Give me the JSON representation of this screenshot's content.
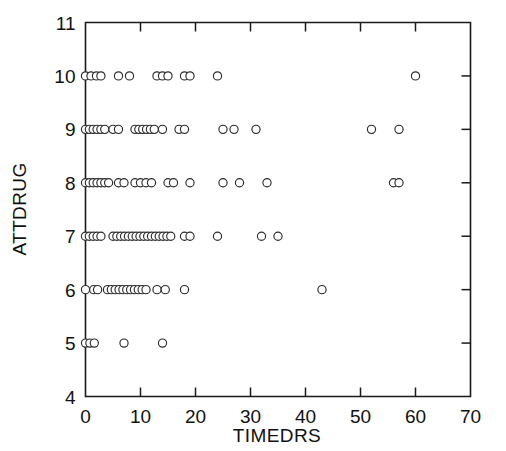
{
  "chart_data": {
    "type": "scatter",
    "title": "",
    "xlabel": "TIMEDRS",
    "ylabel": "ATTDRUG",
    "xlim": [
      0,
      70
    ],
    "ylim": [
      4,
      11
    ],
    "xticks": [
      0,
      10,
      20,
      30,
      40,
      50,
      60,
      70
    ],
    "yticks": [
      4,
      5,
      6,
      7,
      8,
      9,
      10,
      11
    ],
    "xtick_labels": [
      "0",
      "10",
      "20",
      "30",
      "40",
      "50",
      "60",
      "70"
    ],
    "ytick_labels": [
      "4",
      "5",
      "6",
      "7",
      "8",
      "9",
      "10",
      "11"
    ],
    "grid": false,
    "legend": null,
    "marker": "open-circle",
    "marker_color": "#2b2b2b",
    "marker_fill": "#ffffff",
    "series": [
      {
        "name": "observations",
        "points": [
          [
            0,
            10
          ],
          [
            1,
            10
          ],
          [
            2,
            10
          ],
          [
            2.8,
            10
          ],
          [
            6,
            10
          ],
          [
            8,
            10
          ],
          [
            13,
            10
          ],
          [
            14,
            10
          ],
          [
            15,
            10
          ],
          [
            18,
            10
          ],
          [
            19,
            10
          ],
          [
            24,
            10
          ],
          [
            60,
            10
          ],
          [
            0,
            9
          ],
          [
            0.7,
            9
          ],
          [
            1.4,
            9
          ],
          [
            2.1,
            9
          ],
          [
            2.8,
            9
          ],
          [
            3.5,
            9
          ],
          [
            5,
            9
          ],
          [
            6,
            9
          ],
          [
            9,
            9
          ],
          [
            9.7,
            9
          ],
          [
            10.4,
            9
          ],
          [
            11.1,
            9
          ],
          [
            11.8,
            9
          ],
          [
            12.5,
            9
          ],
          [
            14,
            9
          ],
          [
            17,
            9
          ],
          [
            18,
            9
          ],
          [
            25,
            9
          ],
          [
            27,
            9
          ],
          [
            31,
            9
          ],
          [
            52,
            9
          ],
          [
            57,
            9
          ],
          [
            0,
            8
          ],
          [
            0.7,
            8
          ],
          [
            1.4,
            8
          ],
          [
            2.1,
            8
          ],
          [
            2.8,
            8
          ],
          [
            3.5,
            8
          ],
          [
            4.2,
            8
          ],
          [
            6,
            8
          ],
          [
            7,
            8
          ],
          [
            9,
            8
          ],
          [
            10,
            8
          ],
          [
            11,
            8
          ],
          [
            12,
            8
          ],
          [
            15,
            8
          ],
          [
            16,
            8
          ],
          [
            19,
            8
          ],
          [
            25,
            8
          ],
          [
            28,
            8
          ],
          [
            33,
            8
          ],
          [
            56,
            8
          ],
          [
            57,
            8
          ],
          [
            0,
            7
          ],
          [
            0.7,
            7
          ],
          [
            1.4,
            7
          ],
          [
            2.1,
            7
          ],
          [
            2.8,
            7
          ],
          [
            5,
            7
          ],
          [
            5.7,
            7
          ],
          [
            6.4,
            7
          ],
          [
            7.1,
            7
          ],
          [
            7.8,
            7
          ],
          [
            8.5,
            7
          ],
          [
            9.2,
            7
          ],
          [
            9.9,
            7
          ],
          [
            10.6,
            7
          ],
          [
            11.3,
            7
          ],
          [
            12,
            7
          ],
          [
            12.7,
            7
          ],
          [
            13.4,
            7
          ],
          [
            14.1,
            7
          ],
          [
            14.8,
            7
          ],
          [
            15.5,
            7
          ],
          [
            18,
            7
          ],
          [
            19,
            7
          ],
          [
            24,
            7
          ],
          [
            32,
            7
          ],
          [
            35,
            7
          ],
          [
            0,
            6
          ],
          [
            1.5,
            6
          ],
          [
            2.2,
            6
          ],
          [
            4,
            6
          ],
          [
            4.7,
            6
          ],
          [
            5.4,
            6
          ],
          [
            6.1,
            6
          ],
          [
            6.8,
            6
          ],
          [
            7.5,
            6
          ],
          [
            8.2,
            6
          ],
          [
            8.9,
            6
          ],
          [
            9.6,
            6
          ],
          [
            10.3,
            6
          ],
          [
            11,
            6
          ],
          [
            13,
            6
          ],
          [
            14.5,
            6
          ],
          [
            18,
            6
          ],
          [
            43,
            6
          ],
          [
            0,
            5
          ],
          [
            0.8,
            5
          ],
          [
            1.6,
            5
          ],
          [
            7,
            5
          ],
          [
            14,
            5
          ]
        ]
      }
    ]
  },
  "axis": {
    "x_title": "TIMEDRS",
    "y_title": "ATTDRUG"
  }
}
